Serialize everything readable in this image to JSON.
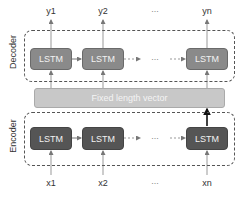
{
  "decoder": {
    "label": "Decoder",
    "cells": [
      "LSTM",
      "LSTM",
      "LSTM"
    ],
    "outputs": [
      "y1",
      "y2",
      "yn"
    ],
    "ellipsis": "..."
  },
  "vector": {
    "label": "Fixed length vector"
  },
  "encoder": {
    "label": "Encoder",
    "cells": [
      "LSTM",
      "LSTM",
      "LSTM"
    ],
    "inputs": [
      "x1",
      "x2",
      "xn"
    ],
    "ellipsis": "..."
  },
  "colors": {
    "decoder_cell": "#8a8a8a",
    "encoder_cell": "#555555",
    "vector_bar": "#c8c8c8"
  }
}
